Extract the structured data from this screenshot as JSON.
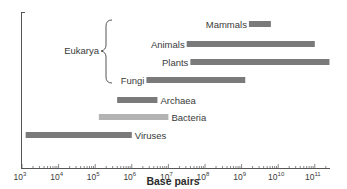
{
  "chart_data": {
    "type": "bar",
    "orientation": "horizontal-range",
    "title": "",
    "xlabel": "Base pairs",
    "ylabel": "",
    "xscale": "log",
    "xlim_exponent": [
      3,
      11.5
    ],
    "x_tick_labels": [
      "10^3",
      "10^4",
      "10^5",
      "10^6",
      "10^7",
      "10^8",
      "10^9",
      "10^10",
      "10^11"
    ],
    "group_annotation": {
      "label": "Eukarya",
      "members": [
        "Mammals",
        "Animals",
        "Plants",
        "Fungi"
      ]
    },
    "grid": false,
    "legend": null,
    "series": [
      {
        "name": "Mammals",
        "log_min": 9.2,
        "log_max": 9.8,
        "color": "#7a7a7a"
      },
      {
        "name": "Animals",
        "log_min": 7.5,
        "log_max": 11.0,
        "color": "#7a7a7a"
      },
      {
        "name": "Plants",
        "log_min": 7.6,
        "log_max": 11.4,
        "color": "#7a7a7a"
      },
      {
        "name": "Fungi",
        "log_min": 6.4,
        "log_max": 9.1,
        "color": "#7a7a7a"
      },
      {
        "name": "Archaea",
        "log_min": 5.6,
        "log_max": 6.7,
        "color": "#7a7a7a"
      },
      {
        "name": "Bacteria",
        "log_min": 5.1,
        "log_max": 7.0,
        "color": "#b3b3b3"
      },
      {
        "name": "Viruses",
        "log_min": 3.1,
        "log_max": 6.0,
        "color": "#7a7a7a"
      }
    ]
  },
  "labels": {
    "xlabel": "Base pairs",
    "eukarya": "Eukarya",
    "ticks": [
      {
        "base": "10",
        "exp": "3"
      },
      {
        "base": "10",
        "exp": "4"
      },
      {
        "base": "10",
        "exp": "5"
      },
      {
        "base": "10",
        "exp": "6"
      },
      {
        "base": "10",
        "exp": "7"
      },
      {
        "base": "10",
        "exp": "8"
      },
      {
        "base": "10",
        "exp": "9"
      },
      {
        "base": "10",
        "exp": "10"
      },
      {
        "base": "10",
        "exp": "11"
      }
    ]
  },
  "colors": {
    "bar_dark": "#7a7a7a",
    "bar_light": "#b3b3b3",
    "axis": "#444444"
  }
}
